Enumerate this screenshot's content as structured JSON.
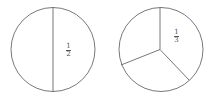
{
  "diagrams": [
    {
      "name": "circle-halves",
      "parts": 2,
      "label": {
        "numerator": "1",
        "denominator": "2"
      }
    },
    {
      "name": "circle-thirds",
      "parts": 3,
      "label": {
        "numerator": "1",
        "denominator": "3"
      }
    }
  ],
  "colors": {
    "stroke": "#555555",
    "background": "#ffffff"
  }
}
